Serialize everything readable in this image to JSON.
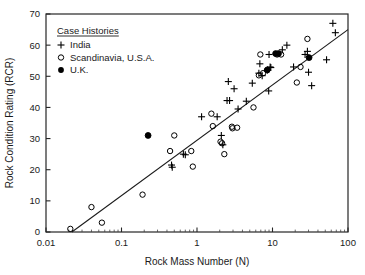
{
  "figure": {
    "name": "rock-condition-rating-vs-rock-mass-number"
  },
  "chart_data": {
    "type": "scatter",
    "title": "",
    "xlabel": "Rock Mass Number (N)",
    "ylabel": "Rock Condition Rating (RCR)",
    "xscale": "log",
    "yscale": "linear",
    "xlim": [
      0.01,
      100
    ],
    "ylim": [
      0,
      70
    ],
    "xticks": [
      "0.01",
      "0.1",
      "1",
      "10",
      "100"
    ],
    "xtick_values": [
      0.01,
      0.1,
      1,
      10,
      100
    ],
    "yticks": [
      "0",
      "10",
      "20",
      "30",
      "40",
      "50",
      "60",
      "70"
    ],
    "ytick_values": [
      0,
      10,
      20,
      30,
      40,
      50,
      60,
      70
    ],
    "grid": false,
    "legend": {
      "title": "Case Histories",
      "position": "upper-left",
      "entries": [
        {
          "label": "India",
          "marker": "plus",
          "color": "#000000"
        },
        {
          "label": "Scandinavia, U.S.A.",
          "marker": "open-circle",
          "color": "#000000"
        },
        {
          "label": "U.K.",
          "marker": "filled-circle",
          "color": "#000000"
        }
      ]
    },
    "trendline": {
      "name": "best-fit-line",
      "x": [
        0.022,
        100
      ],
      "y": [
        0,
        65
      ]
    },
    "series": [
      {
        "name": "India",
        "marker": "plus",
        "points": [
          [
            0.46,
            21.5
          ],
          [
            0.47,
            20.8
          ],
          [
            0.66,
            25.0
          ],
          [
            0.7,
            24.8
          ],
          [
            1.15,
            37.0
          ],
          [
            1.85,
            37.0
          ],
          [
            2.1,
            31.0
          ],
          [
            2.2,
            28.0
          ],
          [
            2.5,
            42.2
          ],
          [
            2.7,
            42.2
          ],
          [
            2.6,
            48.3
          ],
          [
            3.1,
            46.0
          ],
          [
            3.5,
            39.5
          ],
          [
            5.4,
            47.8
          ],
          [
            6.6,
            51.0
          ],
          [
            6.8,
            54.0
          ],
          [
            7.3,
            50.2
          ],
          [
            8.6,
            52.0
          ],
          [
            9.3,
            53.0
          ],
          [
            9.5,
            52.8
          ],
          [
            8.9,
            45.3
          ],
          [
            13.5,
            58.5
          ],
          [
            15.5,
            60.0
          ],
          [
            19.0,
            53.0
          ],
          [
            27.0,
            57.0
          ],
          [
            29.0,
            58.0
          ],
          [
            30.0,
            51.3
          ],
          [
            33.0,
            47.0
          ],
          [
            52.0,
            55.3
          ],
          [
            63.0,
            67.0
          ],
          [
            68.0,
            64.0
          ],
          [
            9.0,
            57.0
          ],
          [
            4.5,
            42.0
          ]
        ]
      },
      {
        "name": "Scandinavia, U.S.A.",
        "marker": "open-circle",
        "points": [
          [
            0.021,
            1.0
          ],
          [
            0.04,
            8.0
          ],
          [
            0.055,
            3.0
          ],
          [
            0.19,
            12.0
          ],
          [
            0.44,
            26.0
          ],
          [
            0.5,
            31.0
          ],
          [
            0.84,
            26.0
          ],
          [
            0.88,
            21.0
          ],
          [
            1.55,
            38.0
          ],
          [
            1.62,
            34.0
          ],
          [
            2.05,
            29.0
          ],
          [
            2.15,
            28.5
          ],
          [
            2.9,
            33.8
          ],
          [
            2.95,
            33.3
          ],
          [
            2.3,
            25.0
          ],
          [
            3.4,
            33.5
          ],
          [
            5.6,
            40.0
          ],
          [
            6.6,
            50.3
          ],
          [
            6.9,
            57.0
          ],
          [
            7.5,
            51.0
          ],
          [
            11.5,
            57.0
          ],
          [
            13.0,
            57.0
          ],
          [
            21.0,
            48.0
          ],
          [
            23.5,
            53.0
          ],
          [
            29.0,
            62.0
          ]
        ]
      },
      {
        "name": "U.K.",
        "marker": "filled-circle",
        "points": [
          [
            0.225,
            31.0
          ],
          [
            8.5,
            52.0
          ],
          [
            11.0,
            57.3
          ],
          [
            12.0,
            57.3
          ],
          [
            30.5,
            56.0
          ]
        ]
      }
    ]
  }
}
